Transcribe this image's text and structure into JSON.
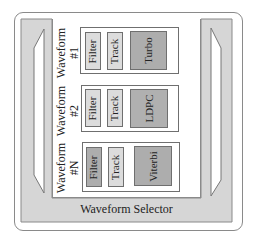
{
  "diagram": {
    "selector_label": "Waveform Selector",
    "colors": {
      "frame_border": "#8a8a8a",
      "selector_fill": "#d6d6d6",
      "light_block": "#dcdcdc",
      "dark_block": "#adadad",
      "medium_block": "#b8b8b8"
    },
    "waveforms": [
      {
        "label_line1": "Waveform",
        "label_line2": "#1",
        "blocks": [
          {
            "label": "Filter",
            "shade": "light"
          },
          {
            "label": "Track",
            "shade": "light"
          },
          {
            "label": "Turbo",
            "shade": "dark"
          }
        ]
      },
      {
        "label_line1": "Waveform",
        "label_line2": "#2",
        "blocks": [
          {
            "label": "Filter",
            "shade": "light"
          },
          {
            "label": "Track",
            "shade": "light"
          },
          {
            "label": "LDPC",
            "shade": "dark"
          }
        ]
      },
      {
        "label_line1": "Waveform",
        "label_line2": "#N",
        "blocks": [
          {
            "label": "Filter",
            "shade": "dark"
          },
          {
            "label": "Track",
            "shade": "light"
          },
          {
            "label": "Viterbi",
            "shade": "dark"
          }
        ]
      }
    ]
  }
}
